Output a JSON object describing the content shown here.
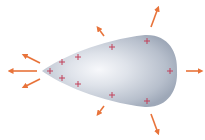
{
  "diagram": {
    "title": "",
    "colors": {
      "background": "#ffffff",
      "conductor_light": "#f4f6fa",
      "conductor_mid": "#c6cdd9",
      "conductor_dark": "#9aa4b5",
      "charge": "#c2405a",
      "field_arrow": "#e8733a"
    },
    "conductor": {
      "shape": "teardrop",
      "tip": [
        42,
        71
      ],
      "right_extent": 176,
      "top": 35,
      "bottom": 107
    },
    "charges": [
      {
        "symbol": "+",
        "x": 50,
        "y": 71
      },
      {
        "symbol": "+",
        "x": 62,
        "y": 62
      },
      {
        "symbol": "+",
        "x": 62,
        "y": 78
      },
      {
        "symbol": "+",
        "x": 78,
        "y": 57
      },
      {
        "symbol": "+",
        "x": 78,
        "y": 84
      },
      {
        "symbol": "+",
        "x": 112,
        "y": 47
      },
      {
        "symbol": "+",
        "x": 112,
        "y": 95
      },
      {
        "symbol": "+",
        "x": 147,
        "y": 41
      },
      {
        "symbol": "+",
        "x": 147,
        "y": 101
      },
      {
        "symbol": "+",
        "x": 170,
        "y": 71
      }
    ],
    "field_arrows": [
      {
        "name": "tip-left",
        "from": [
          37,
          71
        ],
        "to": [
          10,
          71
        ]
      },
      {
        "name": "tip-upper-left",
        "from": [
          40,
          63
        ],
        "to": [
          24,
          55
        ]
      },
      {
        "name": "tip-lower-left",
        "from": [
          40,
          79
        ],
        "to": [
          24,
          87
        ]
      },
      {
        "name": "upper-small",
        "from": [
          104,
          36
        ],
        "to": [
          98,
          28
        ]
      },
      {
        "name": "lower-small",
        "from": [
          104,
          106
        ],
        "to": [
          98,
          114
        ]
      },
      {
        "name": "upper-right",
        "from": [
          151,
          27
        ],
        "to": [
          158,
          8
        ]
      },
      {
        "name": "lower-right",
        "from": [
          151,
          114
        ],
        "to": [
          158,
          133
        ]
      },
      {
        "name": "right",
        "from": [
          186,
          71
        ],
        "to": [
          201,
          71
        ]
      }
    ]
  }
}
